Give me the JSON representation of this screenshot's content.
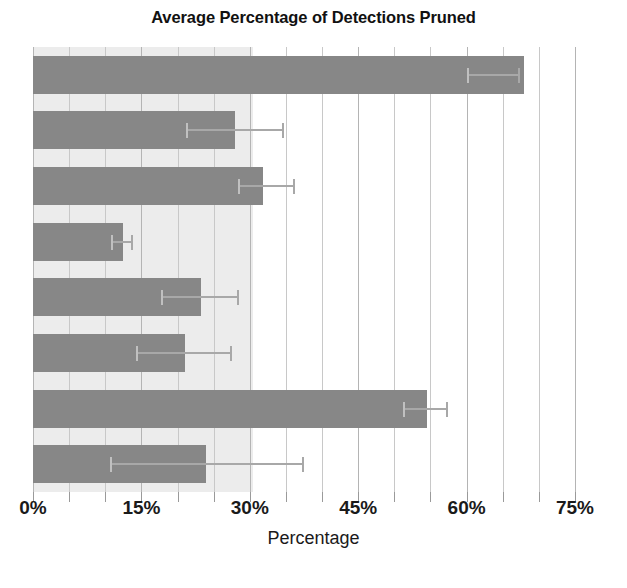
{
  "chart_data": {
    "type": "bar",
    "orientation": "horizontal",
    "title": "Average Percentage of Detections Pruned",
    "xlabel": "Percentage",
    "ylabel": "",
    "xlim": [
      0,
      75
    ],
    "xticks": [
      "0%",
      "15%",
      "30%",
      "45%",
      "60%",
      "75%"
    ],
    "xtick_values": [
      0,
      15,
      30,
      45,
      60,
      75
    ],
    "minor_tick_step": 5,
    "grid": true,
    "legend": "none",
    "bar_color": "#878787",
    "error_color": "#a8a8a8",
    "shaded_band_color": "#ececec",
    "shaded_band_end": 30.5,
    "categories": [
      "",
      "",
      "",
      "",
      "",
      "",
      "",
      ""
    ],
    "values": [
      68.0,
      28.0,
      31.8,
      12.4,
      23.2,
      21.0,
      54.5,
      24.0
    ],
    "error_low": [
      60.0,
      21.2,
      28.4,
      10.8,
      17.7,
      14.3,
      51.2,
      10.7
    ],
    "error_high": [
      67.1,
      34.5,
      36.0,
      13.6,
      28.2,
      27.3,
      57.2,
      37.2
    ],
    "bars": [
      {
        "name": "bar-1",
        "value": 68.0,
        "err_low": 60.0,
        "err_high": 67.1
      },
      {
        "name": "bar-2",
        "value": 28.0,
        "err_low": 21.2,
        "err_high": 34.5
      },
      {
        "name": "bar-3",
        "value": 31.8,
        "err_low": 28.4,
        "err_high": 36.0
      },
      {
        "name": "bar-4",
        "value": 12.4,
        "err_low": 10.8,
        "err_high": 13.6
      },
      {
        "name": "bar-5",
        "value": 23.2,
        "err_low": 17.7,
        "err_high": 28.2
      },
      {
        "name": "bar-6",
        "value": 21.0,
        "err_low": 14.3,
        "err_high": 27.3
      },
      {
        "name": "bar-7",
        "value": 54.5,
        "err_low": 51.2,
        "err_high": 57.2
      },
      {
        "name": "bar-8",
        "value": 24.0,
        "err_low": 10.7,
        "err_high": 37.2
      }
    ]
  }
}
